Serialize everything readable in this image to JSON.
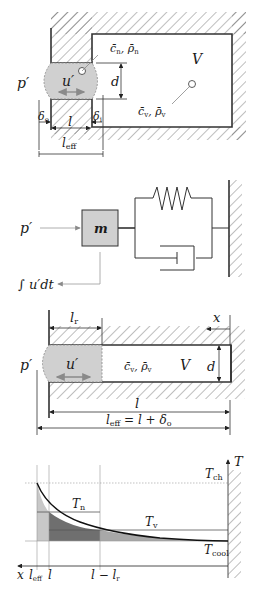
{
  "panel1": {
    "title": "Helmholtz resonator geometry",
    "labels": {
      "pressure": "p′",
      "velocity": "u′",
      "diameter": "d",
      "volume": "V",
      "neck_props": "c̄n, ρ̄n",
      "neck_c": "c̄",
      "neck_c_sub": "n",
      "neck_rho": "ρ̄",
      "neck_rho_sub": "n",
      "cavity_c": "c̄",
      "cavity_c_sub": "v",
      "cavity_rho": "ρ̄",
      "cavity_rho_sub": "v",
      "delta_o": "δ",
      "delta_o_sub": "o",
      "delta_i": "δ",
      "delta_i_sub": "i",
      "length": "l",
      "l_eff": "l",
      "l_eff_sub": "eff"
    }
  },
  "panel2": {
    "title": "Mass-spring-damper analogy",
    "labels": {
      "pressure": "p′",
      "mass": "m",
      "integral": "∫ u′dt"
    }
  },
  "panel3": {
    "title": "Quarter-wave / tube resonator",
    "labels": {
      "l_r": "l",
      "l_r_sub": "r",
      "x_axis": "x",
      "pressure": "p′",
      "velocity": "u′",
      "cavity_c": "c̄",
      "cavity_c_sub": "v",
      "cavity_rho": "ρ̄",
      "cavity_rho_sub": "v",
      "volume": "V",
      "diameter": "d",
      "length": "l",
      "l_eff": "l",
      "l_eff_sub": "eff",
      "l_eff_eq": " = l + δ",
      "l_eff_eq_sub": "o"
    }
  },
  "panel4": {
    "title": "Temperature profile along resonator",
    "labels": {
      "T_axis": "T",
      "T_ch": "T",
      "T_ch_sub": "ch",
      "T_n": "T",
      "T_n_sub": "n",
      "T_v": "T",
      "T_v_sub": "v",
      "T_cool": "T",
      "T_cool_sub": "cool",
      "x_axis": "x",
      "x_leff": "l",
      "x_leff_sub": "eff",
      "x_l": "l",
      "x_l_minus_lr": "l − l",
      "x_l_minus_lr_sub": "r"
    },
    "colors": {
      "light_fill": "#c8c8c8",
      "dark_fill": "#6f6f6f",
      "mid_fill": "#a8a8a8",
      "neck_fill": "#d4d4d4"
    }
  }
}
